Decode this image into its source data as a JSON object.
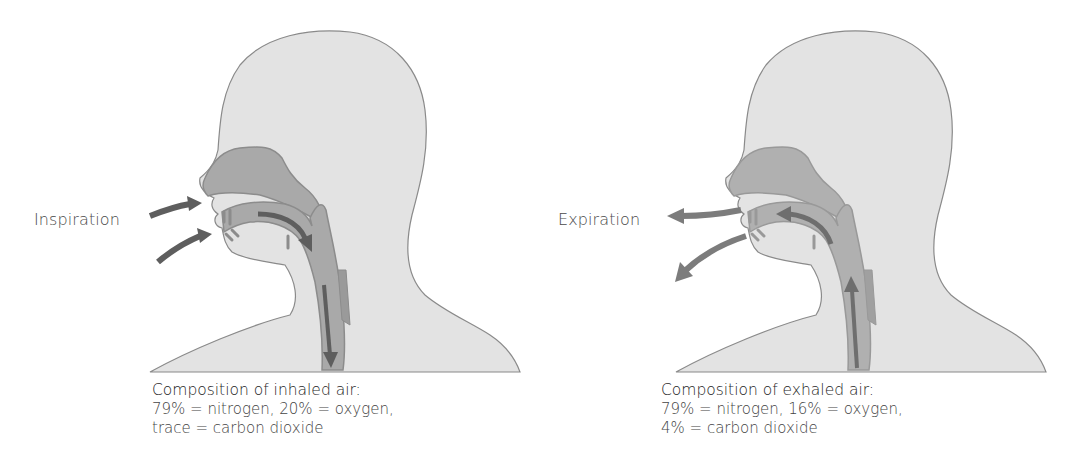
{
  "diagram": {
    "panels": [
      {
        "id": "inhalation",
        "side_label": "Inspiration",
        "caption_title": "Composition of inhaled air:",
        "caption_lines": [
          "79% = nitrogen, 20% = oxygen,",
          "trace = carbon dioxide"
        ],
        "airflow_direction": "inward"
      },
      {
        "id": "exhalation",
        "side_label": "Expiration",
        "caption_title": "Composition of exhaled air:",
        "caption_lines": [
          "79% = nitrogen, 16% = oxygen,",
          "4% = carbon dioxide"
        ],
        "airflow_direction": "outward"
      }
    ],
    "colors": {
      "head_fill": "#e3e3e3",
      "head_outline": "#8a8a8a",
      "airway_fill": "#a9a9a9",
      "airway_dark": "#8c8c8c",
      "arrow": "#5e5e5e",
      "arrow_light": "#7c7c7c"
    }
  }
}
